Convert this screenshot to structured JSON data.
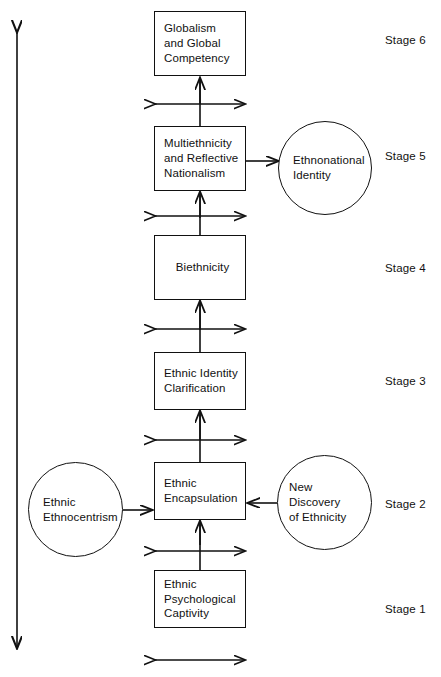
{
  "figure": {
    "type": "flow-diagram",
    "orientation": "bottom-to-top",
    "title_visible": false
  },
  "axis": {
    "name": "vertical-double-arrow",
    "description": "double-headed vertical arrow on left edge spanning full diagram"
  },
  "nodes": [
    {
      "id": "stage1-box",
      "shape": "rectangle",
      "label": "Ethnic\nPsychological\nCaptivity",
      "x": 154,
      "y": 570,
      "w": 92,
      "h": 58
    },
    {
      "id": "stage2-box",
      "shape": "rectangle",
      "label": "Ethnic\nEncapsulation",
      "x": 154,
      "y": 462,
      "w": 92,
      "h": 58
    },
    {
      "id": "stage2-left-circle",
      "shape": "circle",
      "label": "Ethnic\nEthnocentrism",
      "x": 28,
      "y": 462,
      "w": 95,
      "h": 95
    },
    {
      "id": "stage2-right-circle",
      "shape": "circle",
      "label": "New Discovery\nof Ethnicity",
      "x": 277,
      "y": 455,
      "w": 95,
      "h": 95
    },
    {
      "id": "stage3-box",
      "shape": "rectangle",
      "label": "Ethnic Identity\nClarification",
      "x": 154,
      "y": 352,
      "w": 92,
      "h": 58
    },
    {
      "id": "stage4-box",
      "shape": "rectangle",
      "label": "Biethnicity",
      "x": 154,
      "y": 235,
      "w": 92,
      "h": 65
    },
    {
      "id": "stage5-box",
      "shape": "rectangle",
      "label": "Multiethnicity\nand Reflective\nNationalism",
      "x": 154,
      "y": 126,
      "w": 92,
      "h": 65
    },
    {
      "id": "stage5-right-circle",
      "shape": "circle",
      "label": "Ethnonational\nIdentity",
      "x": 278,
      "y": 121,
      "w": 94,
      "h": 94
    },
    {
      "id": "stage6-box",
      "shape": "rectangle",
      "label": "Globalism\nand Global\nCompetency",
      "x": 154,
      "y": 11,
      "w": 92,
      "h": 65
    }
  ],
  "stage_labels": [
    {
      "id": "stage-6",
      "text": "Stage 6",
      "x": 385,
      "y": 34
    },
    {
      "id": "stage-5",
      "text": "Stage 5",
      "x": 385,
      "y": 150
    },
    {
      "id": "stage-4",
      "text": "Stage 4",
      "x": 385,
      "y": 262
    },
    {
      "id": "stage-3",
      "text": "Stage 3",
      "x": 385,
      "y": 375
    },
    {
      "id": "stage-2",
      "text": "Stage 2",
      "x": 385,
      "y": 498
    },
    {
      "id": "stage-1",
      "text": "Stage 1",
      "x": 385,
      "y": 603
    }
  ],
  "connectors": [
    {
      "id": "connector-stage1-to-stage2",
      "type": "cross-arrow",
      "y": 545
    },
    {
      "id": "connector-stage2-to-stage3",
      "type": "cross-arrow",
      "y": 436
    },
    {
      "id": "connector-stage3-to-stage4",
      "type": "cross-arrow",
      "y": 326
    },
    {
      "id": "connector-stage4-to-stage5",
      "type": "cross-arrow",
      "y": 213
    },
    {
      "id": "connector-stage5-to-stage6",
      "type": "cross-arrow",
      "y": 100
    },
    {
      "id": "connector-bottom",
      "type": "horizontal-double-arrow",
      "y": 658
    },
    {
      "id": "arrow-ethnocentrism-to-encapsulation",
      "type": "arrow-right"
    },
    {
      "id": "arrow-new-discovery-to-encapsulation",
      "type": "arrow-left"
    },
    {
      "id": "arrow-multiethnicity-to-ethnonational",
      "type": "arrow-right"
    }
  ]
}
